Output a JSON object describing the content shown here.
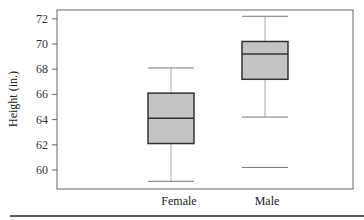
{
  "chart_data": {
    "type": "box",
    "title": "",
    "xlabel": "",
    "ylabel": "Height (in.)",
    "ylim": [
      58.5,
      73
    ],
    "yticks": [
      60,
      62,
      64,
      66,
      68,
      70,
      72
    ],
    "categories": [
      "Female",
      "Male"
    ],
    "series": [
      {
        "name": "Female",
        "whisker_low": 59.1,
        "q1": 62.1,
        "median": 64.1,
        "q3": 66.1,
        "whisker_high": 68.1,
        "outliers": []
      },
      {
        "name": "Male",
        "whisker_low": 64.2,
        "q1": 67.2,
        "median": 69.2,
        "q3": 70.2,
        "whisker_high": 72.2,
        "outliers": [
          60.2
        ]
      }
    ],
    "grid": false,
    "box_fill": "#c4c4c4"
  }
}
